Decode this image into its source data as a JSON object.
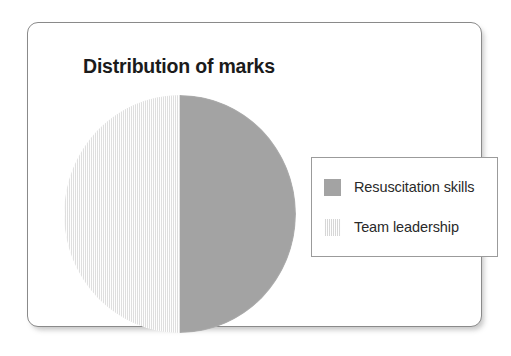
{
  "card": {
    "title": "Distribution of marks",
    "border_color": "#8a8a8a",
    "background_color": "#ffffff"
  },
  "legend": {
    "position": "right",
    "border_color": "#9b9b9b",
    "items": [
      {
        "label": "Resuscitation skills",
        "color": "#a3a3a3",
        "pattern": "solid"
      },
      {
        "label": "Team leadership",
        "color": "#ededed",
        "pattern": "vertical-hatch"
      }
    ]
  },
  "chart_data": {
    "type": "pie",
    "title": "Distribution of marks",
    "xlabel": "",
    "ylabel": "",
    "categories": [
      "Resuscitation skills",
      "Team leadership"
    ],
    "values": [
      50,
      50
    ],
    "value_unit": "%",
    "colors": [
      "#a3a3a3",
      "#ededed"
    ],
    "start_angle": 0,
    "direction": "clockwise",
    "legend": "right",
    "grid": false,
    "data_labels_shown": false
  }
}
